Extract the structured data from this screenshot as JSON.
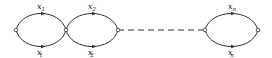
{
  "diagram": {
    "type": "chain-of-loops",
    "colors": {
      "stroke": "#333333",
      "background": "#ffffff"
    },
    "loops": [
      {
        "top_label": "x",
        "top_sub": "1",
        "bottom_label": "x",
        "bottom_sub": "1",
        "bottom_prime": "′"
      },
      {
        "top_label": "x",
        "top_sub": "2",
        "bottom_label": "x",
        "bottom_sub": "2",
        "bottom_prime": "′"
      },
      {
        "top_label": "x",
        "top_sub": "n",
        "bottom_label": "x",
        "bottom_sub": "n",
        "bottom_prime": "′"
      }
    ],
    "connector": "dashed-line"
  }
}
